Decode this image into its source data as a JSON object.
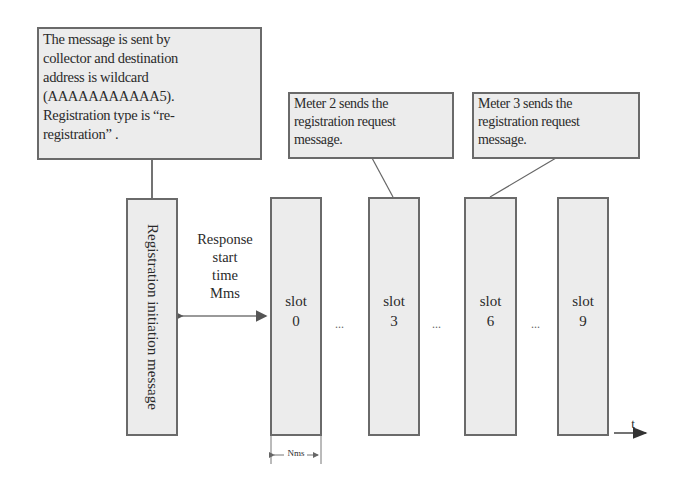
{
  "callouts": {
    "collector": {
      "lines": [
        "The message is sent by",
        "collector and destination",
        "address is wildcard",
        "(AAAAAAAAAAA5).",
        "Registration type is  “re-",
        "registration” ."
      ]
    },
    "meter2": {
      "lines": [
        "Meter 2 sends  the",
        "registration request",
        "message."
      ]
    },
    "meter3": {
      "lines": [
        "Meter 3 sends  the",
        "registration request",
        "message."
      ]
    }
  },
  "registration_box": {
    "label": "Registration initiation message"
  },
  "response": {
    "lines": [
      "Response",
      "start",
      "time",
      "Mms"
    ]
  },
  "slots": [
    {
      "word": "slot",
      "num": "0"
    },
    {
      "word": "slot",
      "num": "3"
    },
    {
      "word": "slot",
      "num": "6"
    },
    {
      "word": "slot",
      "num": "9"
    }
  ],
  "ellipses": [
    "...",
    "...",
    "..."
  ],
  "slot_width_label": "Nms",
  "time_axis_label": "t"
}
